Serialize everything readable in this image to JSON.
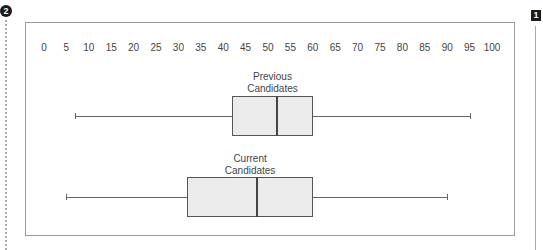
{
  "markers": {
    "left": "2",
    "right": "1"
  },
  "chart_data": {
    "type": "boxplot",
    "title": "",
    "xlabel": "",
    "ylabel": "",
    "xlim": [
      0,
      100
    ],
    "ticks": [
      "0",
      "5",
      "10",
      "15",
      "20",
      "25",
      "30",
      "35",
      "40",
      "45",
      "50",
      "55",
      "60",
      "65",
      "70",
      "75",
      "80",
      "85",
      "90",
      "95",
      "100"
    ],
    "tick_position": "top",
    "grid": false,
    "series": [
      {
        "name": "Previous Candidates",
        "label_lines": [
          "Previous",
          "Candidates"
        ],
        "min": 7,
        "q1": 42,
        "median": 52,
        "q3": 60,
        "max": 95
      },
      {
        "name": "Current Candidates",
        "label_lines": [
          "Current",
          "Candidates"
        ],
        "min": 5,
        "q1": 32,
        "median": 47.5,
        "q3": 60,
        "max": 90
      }
    ]
  }
}
